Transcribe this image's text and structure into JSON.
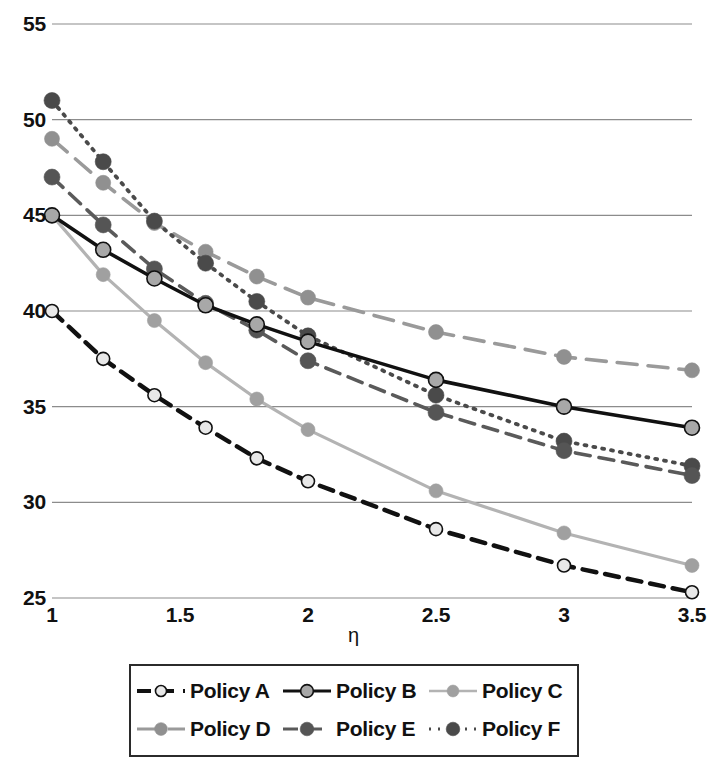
{
  "chart_data": {
    "type": "line",
    "title": "",
    "xlabel": "η",
    "ylabel": "",
    "xlim": [
      1,
      3.5
    ],
    "ylim": [
      25,
      55
    ],
    "grid": true,
    "grid_axis": "y",
    "legend_position": "bottom",
    "legend_columns": 3,
    "x": [
      1,
      1.2,
      1.4,
      1.6,
      1.8,
      2,
      2.5,
      3,
      3.5
    ],
    "xticks": [
      1,
      1.5,
      2,
      2.5,
      3,
      3.5
    ],
    "xtick_labels": [
      "1",
      "1.5",
      "2",
      "2.5",
      "3",
      "3.5"
    ],
    "yticks": [
      25,
      30,
      35,
      40,
      45,
      50,
      55
    ],
    "ytick_labels": [
      "25",
      "30",
      "35",
      "40",
      "45",
      "50",
      "55"
    ],
    "series": [
      {
        "name": "Policy A",
        "values": [
          40.0,
          37.5,
          35.6,
          33.9,
          32.3,
          31.1,
          28.6,
          26.7,
          25.3
        ],
        "color": "#111111",
        "marker_fill": "#e8e8e8",
        "marker_edge": "#111111",
        "dash": "14,9",
        "width": 4.5,
        "marker_size": 6.5
      },
      {
        "name": "Policy B",
        "values": [
          45.0,
          43.2,
          41.7,
          40.3,
          39.3,
          38.4,
          36.4,
          35.0,
          33.9
        ],
        "color": "#111111",
        "marker_fill": "#a8a8a8",
        "marker_edge": "#111111",
        "dash": "none",
        "width": 3.6,
        "marker_size": 7.5
      },
      {
        "name": "Policy C",
        "values": [
          45.0,
          41.9,
          39.5,
          37.3,
          35.4,
          33.8,
          30.6,
          28.4,
          26.7
        ],
        "color": "#b3b3b3",
        "marker_fill": "#a0a0a0",
        "marker_edge": "#a0a0a0",
        "dash": "none",
        "width": 3.2,
        "marker_size": 7.0
      },
      {
        "name": "Policy D",
        "values": [
          49.0,
          46.7,
          44.6,
          43.1,
          41.8,
          40.7,
          38.9,
          37.6,
          36.9
        ],
        "color": "#9a9a9a",
        "marker_fill": "#909090",
        "marker_edge": "#909090",
        "dash": "20,11",
        "width": 3.6,
        "marker_size": 7.5
      },
      {
        "name": "Policy E",
        "values": [
          47.0,
          44.5,
          42.2,
          40.4,
          39.0,
          37.4,
          34.7,
          32.7,
          31.4
        ],
        "color": "#5a5a5a",
        "marker_fill": "#555555",
        "marker_edge": "#555555",
        "dash": "15,9",
        "width": 3.6,
        "marker_size": 8.0
      },
      {
        "name": "Policy F",
        "values": [
          51.0,
          47.8,
          44.7,
          42.5,
          40.5,
          38.7,
          35.6,
          33.2,
          31.9
        ],
        "color": "#4a4a4a",
        "marker_fill": "#4a4a4a",
        "marker_edge": "#4a4a4a",
        "dash": "2,7",
        "width": 3.8,
        "marker_size": 8.0
      }
    ]
  },
  "legend": {
    "rows": [
      [
        {
          "label": "Policy A",
          "series_index": 0
        },
        {
          "label": "Policy B",
          "series_index": 1
        },
        {
          "label": "Policy C",
          "series_index": 2
        }
      ],
      [
        {
          "label": "Policy D",
          "series_index": 3
        },
        {
          "label": "Policy E",
          "series_index": 4
        },
        {
          "label": "Policy F",
          "series_index": 5
        }
      ]
    ]
  },
  "colors": {
    "gridline": "#8c8c8c",
    "background": "#ffffff",
    "text": "#111111",
    "legend_border": "#2b2b2b"
  }
}
